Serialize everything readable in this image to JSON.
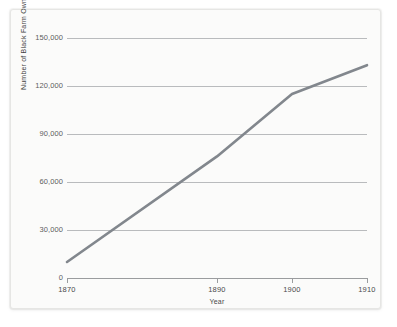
{
  "chart_data": {
    "type": "line",
    "title": "",
    "xlabel": "Year",
    "ylabel": "Number of Black Farm Owners",
    "x": [
      1870,
      1890,
      1900,
      1910
    ],
    "values": [
      10000,
      76000,
      115000,
      133000
    ],
    "series": [
      {
        "name": "Number of Black Farm Owners",
        "values": [
          10000,
          76000,
          115000,
          133000
        ]
      }
    ],
    "xlim": [
      1870,
      1910
    ],
    "ylim": [
      0,
      150000
    ],
    "x_tick_labels": [
      "1870",
      "1890",
      "1900",
      "1910"
    ],
    "y_tick_values": [
      0,
      30000,
      60000,
      90000,
      120000,
      150000
    ],
    "y_tick_labels": [
      "0",
      "30,000",
      "60,000",
      "90,000",
      "120,000",
      "150,000"
    ],
    "grid": "horizontal",
    "legend": "none",
    "line_color": "#82878d",
    "grid_color": "#b9bbbd",
    "axis_color": "#9a9c9e",
    "panel_color": "#fbfbfa",
    "background_color": "#ffffff"
  }
}
